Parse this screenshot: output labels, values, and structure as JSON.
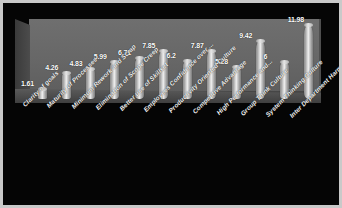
{
  "chart_data": {
    "type": "bar",
    "title": "",
    "subtitle": "",
    "xlabel": "",
    "ylabel": "",
    "ylim": [
      0,
      13
    ],
    "grid": false,
    "legend": "none",
    "style": "3d-cylinder",
    "categories": [
      "Clarity of goals",
      "Maturity of Processes",
      "Minimum Rework and Scrap",
      "Elimination of Scope Creep",
      "Better use of Skillset",
      "Employees Confidence over ...",
      "Productivity Oriented Culture",
      "Competitive Advantage",
      "High Performance and...",
      "Group Think Culture",
      "System Thinking Culture",
      "Inter Department Harmony"
    ],
    "values": [
      1.61,
      4.26,
      4.83,
      5.99,
      6.71,
      7.85,
      6.2,
      7.87,
      5.28,
      9.42,
      6,
      11.98
    ],
    "value_labels": [
      "1.61",
      "4.26",
      "4.83",
      "5.99",
      "6.71",
      "7.85",
      "6.2",
      "7.87",
      "5.28",
      "9.42",
      "6",
      "11.98"
    ]
  },
  "colors": {
    "background": "#050505",
    "frame_border": "#c9c9c9",
    "plot_wall": "#696969",
    "plot_floor": "#4a4a4a",
    "bar_light": "#efefef",
    "bar_mid": "#aaaaaa",
    "bar_dark": "#7d7d7d",
    "label_text": "#ffffff"
  }
}
